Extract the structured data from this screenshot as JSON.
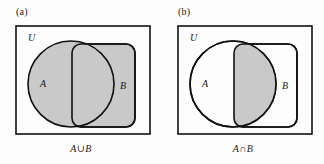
{
  "figure": {
    "background_color": "#fdfdfd",
    "stroke_color": "#111111",
    "shade_color": "#c9c9c9",
    "unshaded_color": "#fdfdfd",
    "width": 324,
    "height": 164
  },
  "panels": [
    {
      "tag": "(a)",
      "universe_label": "U",
      "set_a_label": "A",
      "set_b_label": "B",
      "caption": "A∪B",
      "shaded_region": "union",
      "shaded_description": "both circle A and rectangle B filled gray"
    },
    {
      "tag": "(b)",
      "universe_label": "U",
      "set_a_label": "A",
      "set_b_label": "B",
      "caption": "A∩B",
      "shaded_region": "intersection",
      "shaded_description": "only the overlapping lens of A and B filled gray"
    }
  ]
}
